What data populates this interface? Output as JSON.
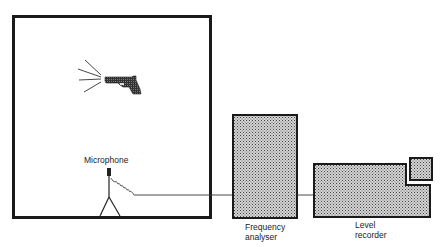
{
  "diagram": {
    "type": "measurement-setup",
    "labels": {
      "microphone": "Microphone",
      "frequency_analyser_line1": "Frequency",
      "frequency_analyser_line2": "analyser",
      "level_recorder_line1": "Level",
      "level_recorder_line2": "recorder"
    },
    "components": [
      {
        "name": "room",
        "kind": "enclosure"
      },
      {
        "name": "pistol",
        "kind": "sound-source"
      },
      {
        "name": "microphone",
        "kind": "sensor"
      },
      {
        "name": "frequency-analyser",
        "kind": "instrument"
      },
      {
        "name": "level-recorder",
        "kind": "instrument"
      }
    ],
    "connections": [
      {
        "from": "microphone",
        "to": "frequency-analyser"
      },
      {
        "from": "frequency-analyser",
        "to": "level-recorder"
      }
    ],
    "colors": {
      "line": "#1a1a1a",
      "fill_pattern_dark": "#555555",
      "fill_pattern_light": "#d8d8d8"
    }
  }
}
